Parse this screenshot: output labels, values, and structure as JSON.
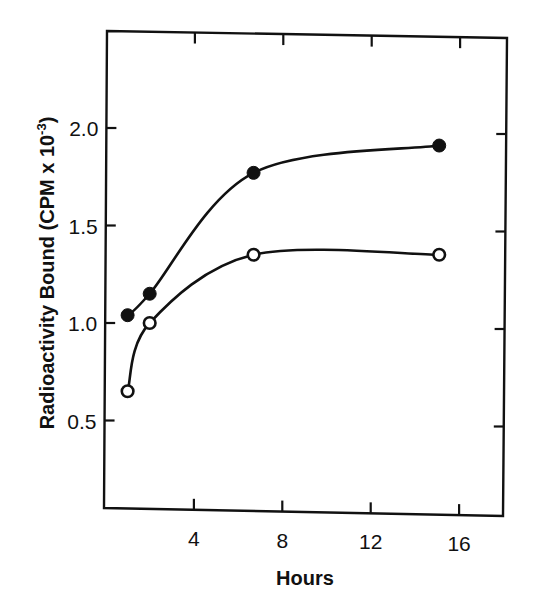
{
  "chart_data": {
    "type": "line",
    "title": "",
    "xlabel": "Hours",
    "ylabel": "Radioactivity Bound (CPM x 10",
    "ylabel_superscript": "-3",
    "ylabel_suffix": ")",
    "xlim": [
      0,
      18
    ],
    "ylim": [
      0,
      2.5
    ],
    "x_ticks": [
      4,
      8,
      12,
      16
    ],
    "x_tick_labels": [
      "4",
      "8",
      "12",
      "16"
    ],
    "y_ticks": [
      0.5,
      1.0,
      1.5,
      2.0
    ],
    "y_tick_labels": [
      "0.5",
      "1.0",
      "1.5",
      "2.0"
    ],
    "grid": false,
    "legend": null,
    "series": [
      {
        "name": "filled circles",
        "marker": "filled-circle",
        "x": [
          1.0,
          2.0,
          6.7,
          15.1
        ],
        "values": [
          1.04,
          1.15,
          1.77,
          1.91
        ]
      },
      {
        "name": "open circles",
        "marker": "open-circle",
        "x": [
          1.0,
          2.0,
          6.7,
          15.1
        ],
        "values": [
          0.65,
          1.0,
          1.35,
          1.35
        ]
      }
    ]
  },
  "colors": {
    "ink": "#111111",
    "background": "#ffffff"
  }
}
